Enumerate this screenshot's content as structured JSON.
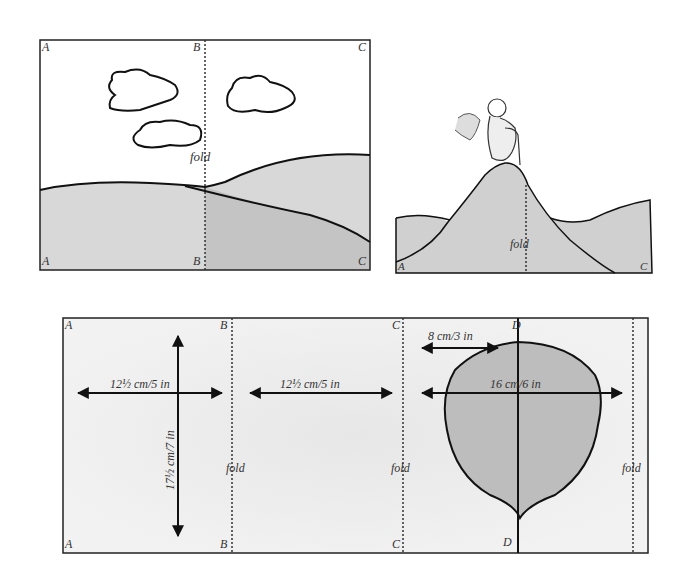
{
  "panel1": {
    "corners": {
      "tl": "A",
      "tm": "B",
      "tr": "C",
      "bl": "A",
      "bm": "B",
      "br": "C"
    },
    "fold_label": "fold"
  },
  "panel2": {
    "corners": {
      "bl": "A",
      "br": "C"
    },
    "fold_label": "fold"
  },
  "panel3": {
    "corners": {
      "a_top": "A",
      "a_bot": "A",
      "b_top": "B",
      "b_bot": "B",
      "c_top": "C",
      "c_bot": "C",
      "d_top": "D",
      "d_bot": "D"
    },
    "fold_label_1": "fold",
    "fold_label_2": "fold",
    "fold_label_3": "fold",
    "dim_width_1": "12½ cm/5 in",
    "dim_width_2": "12½ cm/5 in",
    "dim_height": "17½ cm/7 in",
    "dim_half_balloon": "8 cm/3 in",
    "dim_balloon": "16 cm/6 in"
  },
  "colors": {
    "fill_gray": "#c8c8c8",
    "line": "#111111"
  }
}
